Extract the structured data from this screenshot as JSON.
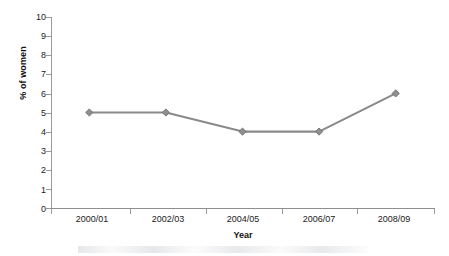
{
  "chart_data": {
    "type": "line",
    "title": "",
    "subtitle": "",
    "xlabel": "Year",
    "ylabel": "% of women",
    "categories": [
      "2000/01",
      "2002/03",
      "2004/05",
      "2006/07",
      "2008/09"
    ],
    "values": [
      5,
      5,
      4,
      4,
      6
    ],
    "series": [
      {
        "name": "% of women",
        "values": [
          5,
          5,
          4,
          4,
          6
        ]
      }
    ],
    "ylim": [
      0,
      10
    ],
    "y_ticks": [
      10,
      9,
      8,
      7,
      6,
      5,
      4,
      3,
      2,
      1,
      0
    ],
    "y_tick_labels": [
      "10",
      "9",
      "8",
      "7",
      "6",
      "5",
      "4",
      "3",
      "2",
      "1",
      "0"
    ],
    "grid": false,
    "legend": false,
    "legend_position": "none",
    "marker": "diamond",
    "annotations": []
  },
  "colors": {
    "line": "#8a8a8a",
    "marker": "#8f8f8f",
    "marker_edge": "#6f6f6f",
    "axis": "#9a9a9a",
    "text": "#1a1a1a",
    "background": "#ffffff"
  }
}
